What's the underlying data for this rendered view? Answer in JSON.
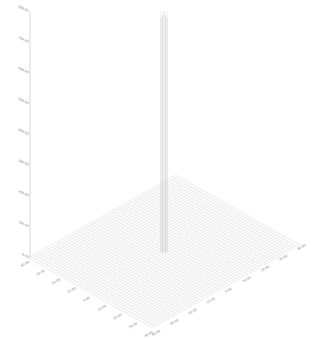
{
  "chart_data": {
    "type": "surface3d",
    "title": "",
    "xlabel": "",
    "ylabel": "",
    "zlabel": "",
    "z_ticks": [
      "0.00",
      "100.00",
      "200.00",
      "300.00",
      "400.00",
      "500.00",
      "600.00",
      "700.00",
      "800.00"
    ],
    "zlim": [
      0,
      800
    ],
    "x_ticks": [
      "-40.00",
      "-30.00",
      "-20.00",
      "-10.00",
      "0.00",
      "10.00",
      "20.00",
      "30.00",
      "40.00"
    ],
    "y_ticks": [
      "-40.00",
      "-30.00",
      "-20.00",
      "-10.00",
      "0.00",
      "10.00",
      "20.00",
      "30.00",
      "40.00"
    ],
    "peak": {
      "x": 0,
      "y": 0,
      "z": 800
    },
    "grid": true,
    "legend": "none",
    "wireframe_color": "#d0d0d0",
    "axis_color": "#bdbdbd"
  }
}
